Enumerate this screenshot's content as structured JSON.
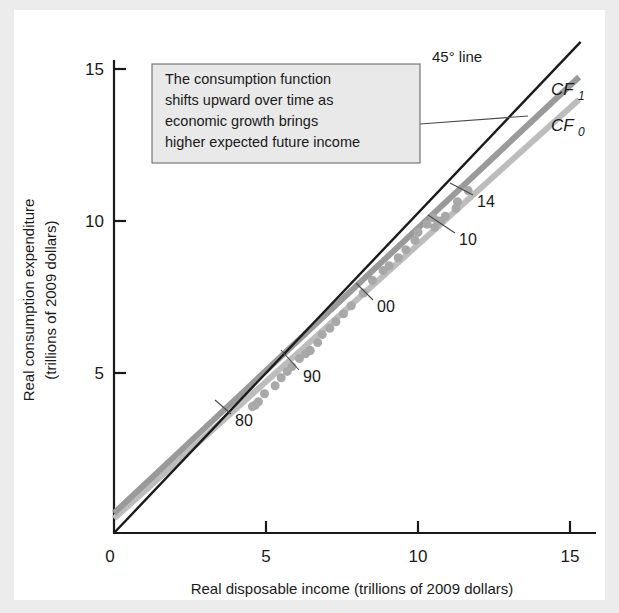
{
  "figure": {
    "background_color": "#ffffff",
    "border_color": "#ececec"
  },
  "axes": {
    "x_title": "Real disposable income (trillions of 2009 dollars)",
    "y_title_line1": "Real consumption expenditure",
    "y_title_line2": "(trillions of 2009 dollars)",
    "x_ticks": [
      "0",
      "5",
      "10",
      "15"
    ],
    "y_ticks": [
      "5",
      "10",
      "15"
    ],
    "origin_label": "0"
  },
  "callout": {
    "lines": [
      "The consumption function",
      "shifts upward over time as",
      "economic growth brings",
      "higher expected future income"
    ],
    "fill": "#e9e9e9",
    "border": "#6b6b6b"
  },
  "labels": {
    "line45": "45° line",
    "cf1_base": "CF",
    "cf1_sub": "1",
    "cf0_base": "CF",
    "cf0_sub": "0",
    "year_80": "80",
    "year_90": "90",
    "year_00": "00",
    "year_10": "10",
    "year_14": "14"
  },
  "chart_data": {
    "type": "scatter",
    "title": "",
    "xlabel": "Real disposable income (trillions of 2009 dollars)",
    "ylabel": "Real consumption expenditure (trillions of 2009 dollars)",
    "xlim": [
      0,
      16.3
    ],
    "ylim": [
      0,
      16.3
    ],
    "xticks": [
      0,
      5,
      10,
      15
    ],
    "yticks": [
      0,
      5,
      10,
      15
    ],
    "grid": false,
    "legend_position": "right-of-curve-ends",
    "colors": {
      "line45": "#1a1a1a",
      "cf1": "#9a9a9a",
      "cf0": "#bdbdbd",
      "points": "#a8a8a8"
    },
    "series": [
      {
        "name": "45° line",
        "type": "line",
        "color": "#1a1a1a",
        "width": 2.4,
        "x": [
          0,
          15.35
        ],
        "y": [
          0,
          15.35
        ]
      },
      {
        "name": "CF1",
        "type": "line",
        "color": "#9a9a9a",
        "width": 6,
        "x": [
          0,
          15.3
        ],
        "y": [
          0.62,
          14.25
        ]
      },
      {
        "name": "CF0",
        "type": "line",
        "color": "#bdbdbd",
        "width": 6,
        "x": [
          0,
          15.3
        ],
        "y": [
          0.45,
          13.55
        ]
      },
      {
        "name": "Observed data (1980-2014)",
        "type": "scatter",
        "color": "#a8a8a8",
        "marker_size": 9,
        "years": [
          1980,
          1981,
          1982,
          1983,
          1984,
          1985,
          1986,
          1987,
          1988,
          1989,
          1990,
          1991,
          1992,
          1993,
          1994,
          1995,
          1996,
          1997,
          1998,
          1999,
          2000,
          2001,
          2002,
          2003,
          2004,
          2005,
          2006,
          2007,
          2008,
          2009,
          2010,
          2011,
          2012,
          2013,
          2014
        ],
        "x": [
          4.55,
          4.65,
          4.75,
          4.95,
          5.3,
          5.5,
          5.7,
          5.85,
          6.1,
          6.3,
          6.45,
          6.45,
          6.7,
          6.85,
          7.1,
          7.3,
          7.55,
          7.8,
          8.2,
          8.5,
          8.85,
          9.05,
          9.35,
          9.6,
          9.9,
          10.0,
          10.3,
          10.5,
          10.65,
          10.55,
          10.75,
          10.9,
          11.25,
          11.3,
          11.65
        ],
        "y": [
          3.95,
          4.0,
          4.1,
          4.35,
          4.6,
          4.85,
          5.05,
          5.2,
          5.45,
          5.6,
          5.7,
          5.7,
          5.95,
          6.2,
          6.4,
          6.6,
          6.85,
          7.1,
          7.5,
          7.9,
          8.2,
          8.35,
          8.6,
          8.85,
          9.15,
          9.4,
          9.65,
          9.85,
          9.75,
          9.55,
          9.75,
          9.9,
          10.15,
          10.35,
          10.7
        ]
      }
    ],
    "annotations": [
      {
        "text": "80",
        "x": 5.3,
        "y": 3.3
      },
      {
        "text": "90",
        "x": 7.75,
        "y": 4.65
      },
      {
        "text": "00",
        "x": 10.0,
        "y": 7.0
      },
      {
        "text": "10",
        "x": 12.4,
        "y": 9.25
      },
      {
        "text": "14",
        "x": 12.75,
        "y": 10.55
      },
      {
        "text": "45° line",
        "x": 12.35,
        "y": 15.25
      },
      {
        "text": "CF1",
        "x": 15.6,
        "y": 14.5
      },
      {
        "text": "CF0",
        "x": 15.6,
        "y": 13.2
      }
    ]
  }
}
